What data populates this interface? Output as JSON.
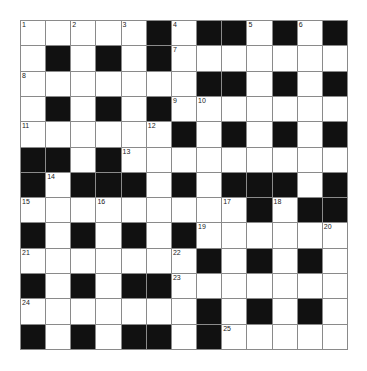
{
  "puzzle": {
    "rows": 13,
    "cols": 13,
    "colors": {
      "black": "#111111",
      "white": "#ffffff",
      "line": "#8a8a8a"
    },
    "layout": [
      "WWWWWBWBBWBWB",
      "WBWBWBWWWWWWW",
      "WWWWWWWBBWBWB",
      "WBWBWBWWWWWWW",
      "WWWWWWBWBWBWB",
      "BBWBWWWWWWWWW",
      "BWBBBWBWBBBWB",
      "WWWWWWWWWBWBB",
      "BWBWBWBWWWWWW",
      "WWWWWWWBWBWBW",
      "BWBWBBWWWWWWW",
      "WWWWWWWBWBWBW",
      "BWBWBBWBWWWWW"
    ],
    "numbers": [
      {
        "r": 0,
        "c": 0,
        "n": "1"
      },
      {
        "r": 0,
        "c": 2,
        "n": "2"
      },
      {
        "r": 0,
        "c": 4,
        "n": "3"
      },
      {
        "r": 0,
        "c": 6,
        "n": "4"
      },
      {
        "r": 0,
        "c": 9,
        "n": "5"
      },
      {
        "r": 0,
        "c": 11,
        "n": "6"
      },
      {
        "r": 1,
        "c": 6,
        "n": "7"
      },
      {
        "r": 2,
        "c": 0,
        "n": "8"
      },
      {
        "r": 3,
        "c": 6,
        "n": "9"
      },
      {
        "r": 3,
        "c": 7,
        "n": "10"
      },
      {
        "r": 4,
        "c": 0,
        "n": "11"
      },
      {
        "r": 4,
        "c": 5,
        "n": "12"
      },
      {
        "r": 5,
        "c": 4,
        "n": "13"
      },
      {
        "r": 6,
        "c": 1,
        "n": "14"
      },
      {
        "r": 7,
        "c": 0,
        "n": "15"
      },
      {
        "r": 7,
        "c": 3,
        "n": "16"
      },
      {
        "r": 7,
        "c": 8,
        "n": "17"
      },
      {
        "r": 7,
        "c": 10,
        "n": "18"
      },
      {
        "r": 8,
        "c": 7,
        "n": "19"
      },
      {
        "r": 8,
        "c": 12,
        "n": "20"
      },
      {
        "r": 9,
        "c": 0,
        "n": "21"
      },
      {
        "r": 9,
        "c": 6,
        "n": "22"
      },
      {
        "r": 10,
        "c": 6,
        "n": "23"
      },
      {
        "r": 11,
        "c": 0,
        "n": "24"
      },
      {
        "r": 12,
        "c": 8,
        "n": "25"
      }
    ]
  }
}
